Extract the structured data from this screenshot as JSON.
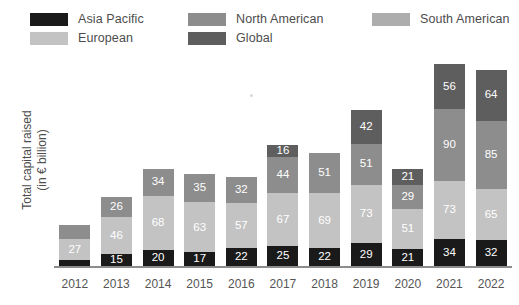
{
  "legend": {
    "items": [
      {
        "label": "Asia Pacific",
        "color": "#1a1a1a",
        "col": 0,
        "row": 0
      },
      {
        "label": "European",
        "color": "#c3c3c3",
        "col": 0,
        "row": 1
      },
      {
        "label": "North American",
        "color": "#8d8d8d",
        "col": 1,
        "row": 0
      },
      {
        "label": "Global",
        "color": "#5e5e5e",
        "col": 1,
        "row": 1
      },
      {
        "label": "South American",
        "color": "#adadad",
        "col": 2,
        "row": 0
      }
    ]
  },
  "axis": {
    "ylabel_line1": "Total capital raised",
    "ylabel_line2": "(in € billion)"
  },
  "chart_data": {
    "type": "bar",
    "stacked": true,
    "title": "",
    "xlabel": "",
    "ylabel": "Total capital raised (in € billion)",
    "ylim": [
      0,
      250
    ],
    "grid": false,
    "legend_position": "top",
    "categories": [
      "2012",
      "2013",
      "2014",
      "2015",
      "2016",
      "2017",
      "2018",
      "2019",
      "2020",
      "2021",
      "2022"
    ],
    "series": [
      {
        "name": "Asia Pacific",
        "color": "#1a1a1a",
        "values": [
          7,
          15,
          20,
          17,
          22,
          25,
          22,
          29,
          21,
          34,
          32
        ],
        "labels": [
          "",
          "15",
          "20",
          "17",
          "22",
          "25",
          "22",
          "29",
          "21",
          "34",
          "32"
        ]
      },
      {
        "name": "European",
        "color": "#c3c3c3",
        "values": [
          27,
          46,
          68,
          63,
          57,
          67,
          69,
          73,
          51,
          73,
          65
        ],
        "labels": [
          "27",
          "46",
          "68",
          "63",
          "57",
          "67",
          "69",
          "73",
          "51",
          "73",
          "65"
        ]
      },
      {
        "name": "North American",
        "color": "#8d8d8d",
        "values": [
          18,
          26,
          34,
          35,
          32,
          44,
          51,
          51,
          29,
          90,
          85
        ],
        "labels": [
          "",
          "26",
          "34",
          "35",
          "32",
          "44",
          "51",
          "51",
          "29",
          "90",
          "85"
        ]
      },
      {
        "name": "Global",
        "color": "#5e5e5e",
        "values": [
          0,
          0,
          0,
          0,
          0,
          16,
          0,
          42,
          21,
          56,
          64
        ],
        "labels": [
          "",
          "",
          "",
          "",
          "",
          "16",
          "",
          "42",
          "21",
          "56",
          "64"
        ]
      }
    ],
    "totals": [
      52,
      87,
      122,
      115,
      111,
      152,
      142,
      195,
      122,
      253,
      246
    ]
  }
}
